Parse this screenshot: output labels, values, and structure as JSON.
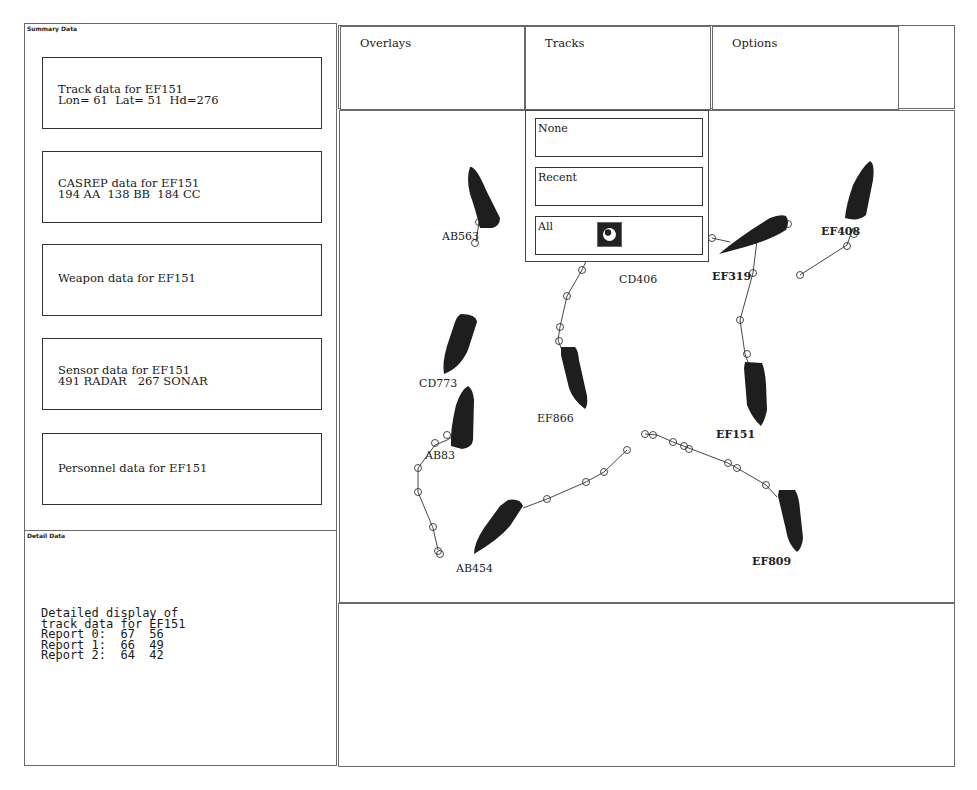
{
  "summary_panel": {
    "title": "Summary Data",
    "boxes": [
      {
        "line1": "Track data for EF151",
        "line2": "Lon= 61  Lat= 51  Hd=276"
      },
      {
        "line1": "CASREP data for EF151",
        "line2": "194 AA  138 BB  184 CC"
      },
      {
        "line1": "Weapon data for EF151",
        "line2": ""
      },
      {
        "line1": "Sensor data for EF151",
        "line2": "491 RADAR   267 SONAR"
      },
      {
        "line1": "Personnel data for EF151",
        "line2": ""
      }
    ]
  },
  "detail_panel": {
    "title": "Detail Data",
    "lines": [
      "Detailed display of",
      "track data for EF151",
      "Report 0:  67  56",
      "Report 1:  66  49",
      "Report 2:  64  42"
    ]
  },
  "menu": {
    "overlays": "Overlays",
    "tracks": "Tracks",
    "options": "Options"
  },
  "tracks_dropdown": {
    "options": [
      "None",
      "Recent",
      "All"
    ],
    "selected": "All",
    "selected_icon": "radio-selected-icon"
  },
  "map": {
    "ships": [
      {
        "id": "AB563",
        "label": "AB563"
      },
      {
        "id": "CD406",
        "label": "CD406"
      },
      {
        "id": "EF319",
        "label": "EF319"
      },
      {
        "id": "EF408",
        "label": "EF408"
      },
      {
        "id": "CD773",
        "label": "CD773"
      },
      {
        "id": "EF866",
        "label": "EF866"
      },
      {
        "id": "EF151",
        "label": "EF151"
      },
      {
        "id": "AB83",
        "label": "AB83"
      },
      {
        "id": "AB454",
        "label": "AB454"
      },
      {
        "id": "EF809",
        "label": "EF809"
      }
    ],
    "selected_track": "EF151"
  },
  "colors": {
    "ship_fill": "#1e1e1e",
    "border": "#6a6a6a",
    "background": "#ffffff"
  }
}
